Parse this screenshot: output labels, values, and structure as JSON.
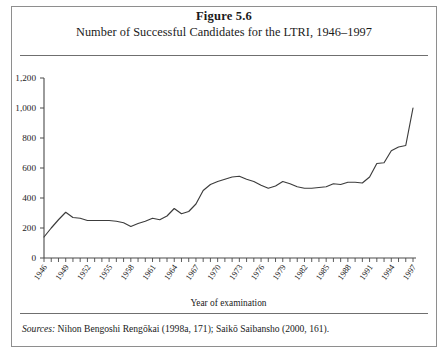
{
  "figure": {
    "number_label": "Figure 5.6",
    "title": "Number of Successful Candidates for the LTRI, 1946–1997",
    "sources_label": "Sources:",
    "sources_text": " Nihon Bengoshi Rengōkai (1998a, 171); Saikō Saibansho (2000, 161)."
  },
  "style": {
    "line_color": "#3c3c3c",
    "axis_color": "#4a4a4a",
    "frame_color": "#8e8e8e",
    "rule_color": "#6f6f6f",
    "background": "#ffffff"
  },
  "chart_data": {
    "type": "line",
    "title": "Number of Successful Candidates for the LTRI, 1946–1997",
    "xlabel": "Year of examination",
    "ylabel": "",
    "ylim": [
      0,
      1200
    ],
    "xlim": [
      1946,
      1997
    ],
    "ytick_step": 200,
    "yticks": [
      0,
      200,
      400,
      600,
      800,
      1000,
      1200
    ],
    "ytick_labels": [
      "0",
      "200",
      "400",
      "600",
      "800",
      "1,000",
      "1,200"
    ],
    "xtick_step": 1,
    "xtick_label_step": 3,
    "xtick_labels": [
      "1946",
      "1949",
      "1952",
      "1955",
      "1958",
      "1961",
      "1964",
      "1967",
      "1970",
      "1973",
      "1976",
      "1979",
      "1982",
      "1985",
      "1988",
      "1991",
      "1994",
      "1997"
    ],
    "grid": false,
    "legend": false,
    "x": [
      1946,
      1947,
      1948,
      1949,
      1950,
      1951,
      1952,
      1953,
      1954,
      1955,
      1956,
      1957,
      1958,
      1959,
      1960,
      1961,
      1962,
      1963,
      1964,
      1965,
      1966,
      1967,
      1968,
      1969,
      1970,
      1971,
      1972,
      1973,
      1974,
      1975,
      1976,
      1977,
      1978,
      1979,
      1980,
      1981,
      1982,
      1983,
      1984,
      1985,
      1986,
      1987,
      1988,
      1989,
      1990,
      1991,
      1992,
      1993,
      1994,
      1995,
      1996,
      1997
    ],
    "values": [
      140,
      200,
      255,
      305,
      270,
      265,
      250,
      250,
      250,
      250,
      245,
      235,
      210,
      230,
      245,
      265,
      255,
      280,
      330,
      295,
      310,
      360,
      450,
      490,
      510,
      525,
      540,
      545,
      525,
      510,
      485,
      465,
      480,
      510,
      495,
      475,
      465,
      465,
      470,
      475,
      495,
      490,
      505,
      505,
      500,
      540,
      630,
      635,
      715,
      740,
      750,
      1000
    ],
    "series_name": "Successful candidates"
  }
}
